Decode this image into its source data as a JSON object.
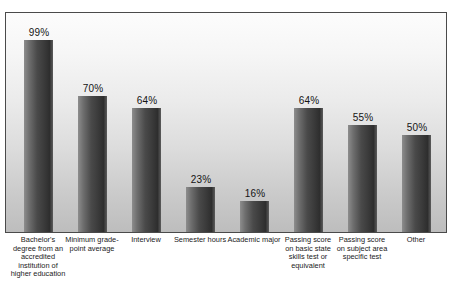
{
  "chart_data": {
    "type": "bar",
    "title": "",
    "subtitle": "",
    "xlabel": "",
    "ylabel": "",
    "ylim": [
      0,
      100
    ],
    "grid": false,
    "legend": false,
    "value_suffix": "%",
    "categories": [
      "Bachelor's degree from an accredited institution of higher education",
      "Minimum grade-point average",
      "Interview",
      "Semester hours",
      "Academic major",
      "Passing score on basic state skills test or equivalent",
      "Passing score on subject area specific test",
      "Other"
    ],
    "values": [
      99,
      70,
      64,
      23,
      16,
      64,
      55,
      50
    ],
    "value_labels": [
      "99%",
      "70%",
      "64%",
      "23%",
      "16%",
      "64%",
      "55%",
      "50%"
    ],
    "colors": {
      "bar_light": "#8d8d8d",
      "bar_dark": "#2e2e2e",
      "plot_background_top": "#fcfcfc",
      "plot_background_bottom": "#bdbdbd",
      "frame_border": "#4a4a4a",
      "label_text": "#1a1a1a",
      "page_background": "#ffffff"
    }
  }
}
